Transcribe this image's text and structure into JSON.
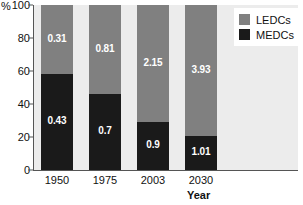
{
  "chart_data": {
    "type": "bar",
    "subtype": "100% stacked bar",
    "title": "",
    "xlabel": "Year",
    "ylabel": "%",
    "ylim": [
      0,
      100
    ],
    "yticks": [
      0,
      20,
      40,
      60,
      80,
      100
    ],
    "grid": false,
    "legend_position": "top-right",
    "categories": [
      "1950",
      "1975",
      "2003",
      "2030"
    ],
    "series": [
      {
        "name": "LEDCs",
        "color": "#808080",
        "values": [
          42,
          54,
          71,
          79.5
        ],
        "labels": [
          "0.31",
          "0.81",
          "2.15",
          "3.93"
        ]
      },
      {
        "name": "MEDCs",
        "color": "#1a1a1a",
        "values": [
          58,
          46,
          29,
          20.5
        ],
        "labels": [
          "0.43",
          "0.7",
          "0.9",
          "1.01"
        ]
      }
    ],
    "stack_order_top_to_bottom": [
      "LEDCs",
      "MEDCs"
    ]
  },
  "axes": {
    "y_unit_label": "%",
    "y_tick_labels": [
      "100",
      "80",
      "60",
      "40",
      "20",
      "0"
    ],
    "x_tick_labels": [
      "1950",
      "1975",
      "2003",
      "2030"
    ],
    "x_axis_title": "Year"
  },
  "legend": {
    "items": [
      {
        "label": "LEDCs",
        "color": "#808080"
      },
      {
        "label": "MEDCs",
        "color": "#1a1a1a"
      }
    ]
  },
  "colors": {
    "ledc": "#808080",
    "medc": "#1a1a1a",
    "plot_background": "#ececec",
    "page_background": "#ffffff",
    "axis": "#555555",
    "text": "#111111",
    "label_text": "#ffffff"
  }
}
